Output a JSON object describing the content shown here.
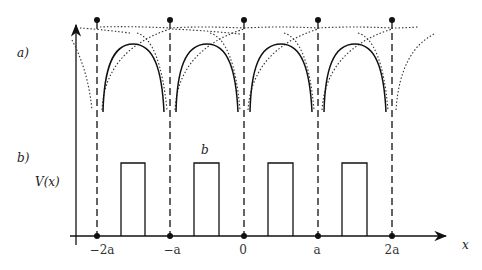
{
  "figure": {
    "panel_a_label": "a)",
    "panel_b_label": "b)",
    "y_axis_label": "V(x)",
    "x_axis_label": "x",
    "barrier_width_label": "b",
    "ticks": [
      "−2a",
      "−a",
      "0",
      "a",
      "2a"
    ],
    "lattice_sites": 5,
    "barriers": 4,
    "colors": {
      "ink": "#111111",
      "dotted": "#333333"
    }
  }
}
